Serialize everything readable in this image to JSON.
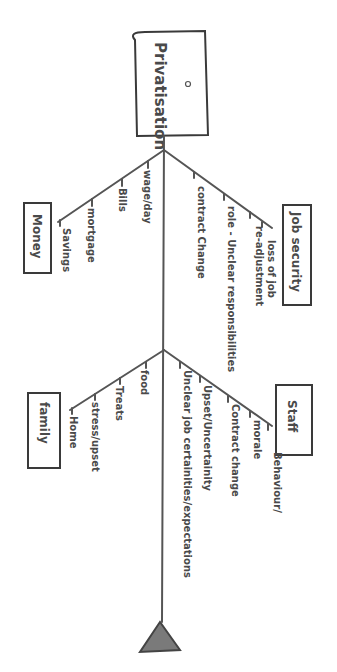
{
  "diagram": {
    "type": "fishbone",
    "orientation": "rotated 90deg clockwise (head at top, tail at bottom)",
    "head": {
      "label": "Privatisation"
    },
    "categories": [
      {
        "name": "Job security",
        "side": "right",
        "causes": [
          "loss of job",
          "re-adjustment",
          "role - Unclear responsibilities",
          "contract Change"
        ]
      },
      {
        "name": "Money",
        "side": "left",
        "causes": [
          "wage/day",
          "Bills",
          "mortgage",
          "Savings"
        ]
      },
      {
        "name": "Staff",
        "side": "right",
        "causes": [
          "Behaviour/",
          "morale",
          "Contract change",
          "Upset/Uncertainity",
          "Unclear job certainities/expectations"
        ]
      },
      {
        "name": "family",
        "side": "left",
        "causes": [
          "food",
          "Treats",
          "stress/upset",
          "Home"
        ]
      }
    ],
    "colors": {
      "ink": "#555555",
      "text": "#4a4a4a",
      "background": "#ffffff"
    }
  }
}
